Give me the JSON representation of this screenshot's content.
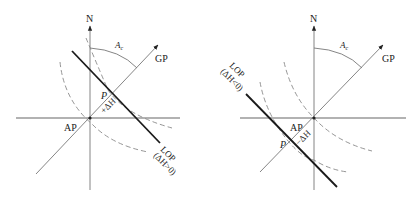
{
  "figures": [
    {
      "id": "left",
      "case": "positive intercept",
      "labels": {
        "north": "N",
        "gp": "GP",
        "azimuth": "A",
        "azimuth_sub": "c",
        "ap": "AP",
        "p": "P",
        "delta_h": "+ΔH",
        "lop": "LOP",
        "lop_condition": "(ΔH>0)"
      }
    },
    {
      "id": "right",
      "case": "negative intercept",
      "labels": {
        "north": "N",
        "gp": "GP",
        "azimuth": "A",
        "azimuth_sub": "c",
        "ap": "AP",
        "p": "P",
        "delta_h": "−ΔH",
        "lop": "LOP",
        "lop_condition": "(ΔH<0)"
      }
    }
  ],
  "colors": {
    "thin_line": "#777777",
    "thick_line": "#1a1a1a",
    "dashed": "#8a8a8a",
    "text": "#222222"
  }
}
